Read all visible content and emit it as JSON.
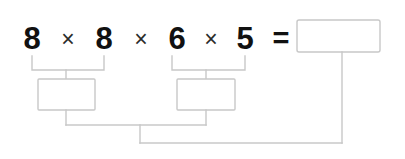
{
  "worksheet": {
    "title": "Multiplication grouping worksheet",
    "background_color": "#ffffff",
    "line_color": "#c8c8c8",
    "box_fill_color": "#ffffff",
    "digit_color": "#111111",
    "operator_color": "#2b2b2b"
  },
  "expression": {
    "full_text": "8 × 8 × 6 × 5 =",
    "operands": [
      {
        "value": "8",
        "x": 32
      },
      {
        "value": "8",
        "x": 104
      },
      {
        "value": "6",
        "x": 177
      },
      {
        "value": "5",
        "x": 245
      }
    ],
    "operators": [
      {
        "symbol": "×",
        "x": 68
      },
      {
        "symbol": "×",
        "x": 141
      },
      {
        "symbol": "×",
        "x": 211
      }
    ],
    "equals": {
      "symbol": "=",
      "x": 281
    },
    "baseline_y": 49
  },
  "result_box": {
    "value": "",
    "placeholder": "",
    "x": 297,
    "y": 20,
    "width": 83,
    "height": 32
  },
  "groups": [
    {
      "name": "group-1",
      "operands": [
        "8",
        "8"
      ],
      "bracket_left_x": 32,
      "bracket_right_x": 104,
      "bracket_top_y": 56,
      "bracket_bottom_y": 70,
      "stem_x": 66,
      "box": {
        "value": "",
        "placeholder": "",
        "x": 38,
        "y": 79,
        "width": 57,
        "height": 31
      }
    },
    {
      "name": "group-2",
      "operands": [
        "6",
        "5"
      ],
      "bracket_left_x": 172,
      "bracket_right_x": 245,
      "bracket_top_y": 56,
      "bracket_bottom_y": 70,
      "stem_x": 206,
      "box": {
        "value": "",
        "placeholder": "",
        "x": 177,
        "y": 79,
        "width": 58,
        "height": 31
      }
    }
  ],
  "merge": {
    "join_y": 125,
    "left_stem_x": 66,
    "right_stem_x": 206,
    "down_stem_x": 140,
    "final_y": 143,
    "final_right_x": 342,
    "result_descender_x": 342,
    "result_descender_top_y": 52
  }
}
